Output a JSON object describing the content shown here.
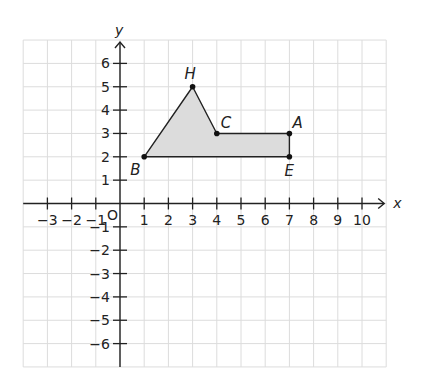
{
  "chart_data": {
    "type": "coordinate-plane",
    "xlabel": "x",
    "ylabel": "y",
    "origin_label": "O",
    "xlim": [
      -4,
      11
    ],
    "ylim": [
      -7,
      7
    ],
    "x_ticks": [
      -3,
      -2,
      -1,
      1,
      2,
      3,
      4,
      5,
      6,
      7,
      8,
      9,
      10
    ],
    "y_ticks": [
      -6,
      -5,
      -4,
      -3,
      -2,
      -1,
      1,
      2,
      3,
      4,
      5,
      6
    ],
    "grid": true,
    "polygon": {
      "vertices_order": [
        "B",
        "H",
        "C",
        "A",
        "E"
      ],
      "fill": "#dcdcdc",
      "stroke": "#222222"
    },
    "points": [
      {
        "name": "H",
        "x": 3,
        "y": 5
      },
      {
        "name": "C",
        "x": 4,
        "y": 3
      },
      {
        "name": "A",
        "x": 7,
        "y": 3
      },
      {
        "name": "B",
        "x": 1,
        "y": 2
      },
      {
        "name": "E",
        "x": 7,
        "y": 2
      }
    ]
  },
  "layout": {
    "origin_px": [
      120,
      203.5
    ],
    "x_unit": 24.2,
    "y_unit": 23.35
  }
}
